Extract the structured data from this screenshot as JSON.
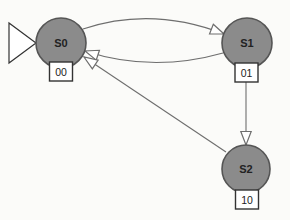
{
  "diagram": {
    "kind": "finite-state-machine",
    "states": [
      {
        "id": "S0",
        "label": "S0",
        "output": "00",
        "initial": true
      },
      {
        "id": "S1",
        "label": "S1",
        "output": "01",
        "initial": false
      },
      {
        "id": "S2",
        "label": "S2",
        "output": "10",
        "initial": false
      }
    ],
    "transitions": [
      {
        "from": "S0",
        "to": "S1",
        "style": "curved-up"
      },
      {
        "from": "S1",
        "to": "S0",
        "style": "curved-down"
      },
      {
        "from": "S1",
        "to": "S2",
        "style": "straight-vertical"
      },
      {
        "from": "S2",
        "to": "S0",
        "style": "straight-diagonal"
      }
    ],
    "colors": {
      "state_fill": "#8b8b8b",
      "state_border": "#555555",
      "edge": "#6e6e6e",
      "box_fill": "#ffffff",
      "box_border": "#333333",
      "arrow_fill": "#ffffff",
      "text": "#222222",
      "background": "#fbfbf9"
    }
  }
}
